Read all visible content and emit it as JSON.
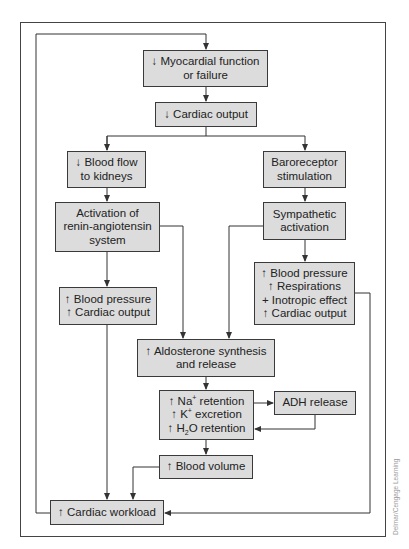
{
  "diagram": {
    "type": "flowchart",
    "colors": {
      "box_fill": "#dcdcdc",
      "box_border": "#3a3a3a",
      "line": "#333333"
    },
    "nodes": {
      "myocardial": {
        "lines": [
          "↓ Myocardial function",
          "or failure"
        ]
      },
      "cardiac_output_down": {
        "lines": [
          "↓ Cardiac output"
        ]
      },
      "blood_flow": {
        "lines": [
          "↓ Blood flow",
          "to kidneys"
        ]
      },
      "baroreceptor": {
        "lines": [
          "Baroreceptor",
          "stimulation"
        ]
      },
      "renin": {
        "lines": [
          "Activation of",
          "renin-angiotensin",
          "system"
        ]
      },
      "sympathetic": {
        "lines": [
          "Sympathetic",
          "activation"
        ]
      },
      "bp_left": {
        "lines": [
          "↑ Blood pressure",
          "↑ Cardiac output"
        ]
      },
      "bp_right": {
        "lines": [
          "↑ Blood pressure",
          "↑ Respirations",
          "+ Inotropic effect",
          "↑ Cardiac output"
        ]
      },
      "aldosterone": {
        "lines": [
          "↑ Aldosterone synthesis",
          "and release"
        ]
      },
      "retention": {
        "line1": {
          "prefix": "↑ Na",
          "sup": "+",
          "suffix": " retention"
        },
        "line2": {
          "prefix": "↑ K",
          "sup": "+",
          "suffix": " excretion"
        },
        "line3": {
          "prefix": "↑ H",
          "sub": "2",
          "suffix": "O retention"
        }
      },
      "adh": {
        "lines": [
          "ADH release"
        ]
      },
      "blood_volume": {
        "lines": [
          "↑ Blood volume"
        ]
      },
      "workload": {
        "lines": [
          "↑ Cardiac workload"
        ]
      }
    },
    "edges": [
      [
        "myocardial",
        "cardiac_output_down"
      ],
      [
        "cardiac_output_down",
        "blood_flow"
      ],
      [
        "cardiac_output_down",
        "baroreceptor"
      ],
      [
        "blood_flow",
        "renin"
      ],
      [
        "baroreceptor",
        "sympathetic"
      ],
      [
        "renin",
        "bp_left"
      ],
      [
        "renin",
        "aldosterone"
      ],
      [
        "sympathetic",
        "aldosterone"
      ],
      [
        "sympathetic",
        "bp_right"
      ],
      [
        "aldosterone",
        "retention"
      ],
      [
        "retention",
        "adh"
      ],
      [
        "adh",
        "retention"
      ],
      [
        "retention",
        "blood_volume"
      ],
      [
        "blood_volume",
        "workload"
      ],
      [
        "bp_left",
        "workload"
      ],
      [
        "bp_right",
        "workload"
      ],
      [
        "workload",
        "myocardial"
      ]
    ],
    "watermark": "Delmar/Cengage Learning"
  }
}
